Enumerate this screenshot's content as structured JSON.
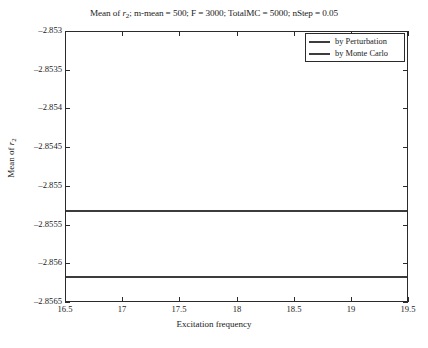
{
  "chart_data": {
    "type": "line",
    "title": "Mean of r2; m-mean = 500; F = 3000; TotalMC = 5000; nStep = 0.05",
    "title_parts": {
      "prefix": "Mean of ",
      "var": "r",
      "sub": "2",
      "suffix": "; m-mean = 500; F = 3000; TotalMC = 5000; nStep = 0.05"
    },
    "xlabel": "Excitation frequency",
    "ylabel": "Mean of r2",
    "ylabel_parts": {
      "prefix": "Mean of ",
      "var": "r",
      "sub": "2"
    },
    "xlim": [
      16.5,
      19.5
    ],
    "ylim": [
      -2.8565,
      -2.853
    ],
    "xticks": [
      16.5,
      17,
      17.5,
      18,
      18.5,
      19,
      19.5
    ],
    "xticklabels": [
      "16.5",
      "17",
      "17.5",
      "18",
      "18.5",
      "19",
      "19.5"
    ],
    "yticks": [
      -2.853,
      -2.8535,
      -2.854,
      -2.8545,
      -2.855,
      -2.8555,
      -2.856,
      -2.8565
    ],
    "yticklabels": [
      "-2.853",
      "-2.8535",
      "-2.854",
      "-2.8545",
      "-2.855",
      "-2.8555",
      "-2.856",
      "-2.8565"
    ],
    "grid": false,
    "legend_position": "upper right",
    "series": [
      {
        "name": "by Perturbation",
        "color": "#3c3c3c",
        "x": [
          16.5,
          19.5
        ],
        "values": [
          -2.85531,
          -2.85531
        ]
      },
      {
        "name": "by Monte Carlo",
        "color": "#3c3c3c",
        "x": [
          16.5,
          19.5
        ],
        "values": [
          -2.85617,
          -2.85617
        ]
      }
    ]
  },
  "legend": {
    "items": [
      {
        "label": "by Perturbation"
      },
      {
        "label": "by Monte Carlo"
      }
    ]
  }
}
